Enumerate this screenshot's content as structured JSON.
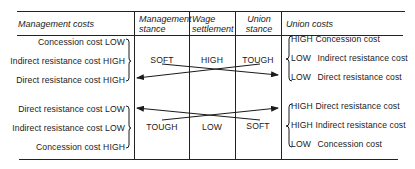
{
  "headers": {
    "management_costs": "Management costs",
    "management_stance": [
      "Management",
      "stance"
    ],
    "wage_settlement": [
      "Wage",
      "settlement"
    ],
    "union_stance": [
      "Union",
      "stance"
    ],
    "union_costs": "Union costs"
  },
  "top_block": {
    "management_costs": [
      {
        "item": "Concession cost",
        "level": "LOW"
      },
      {
        "item": "Indirect resistance cost",
        "level": "HIGH"
      },
      {
        "item": "Direct resistance cost",
        "level": "HIGH"
      }
    ],
    "management_stance": "SOFT",
    "wage_settlement": "HIGH",
    "union_stance": "TOUGH",
    "union_costs": [
      {
        "level": "HIGH",
        "item": "Concession cost"
      },
      {
        "level": "LOW",
        "item": "Indirect resistance cost"
      },
      {
        "level": "LOW",
        "item": "Direct resistance cost"
      }
    ]
  },
  "bottom_block": {
    "management_costs": [
      {
        "item": "Direct resistance cost",
        "level": "LOW"
      },
      {
        "item": "Indirect resistance cost",
        "level": "LOW"
      },
      {
        "item": "Concession cost",
        "level": "HIGH"
      }
    ],
    "management_stance": "TOUGH",
    "wage_settlement": "LOW",
    "union_stance": "SOFT",
    "union_costs": [
      {
        "level": "HIGH",
        "item": "Direct resistance cost"
      },
      {
        "level": "HIGH",
        "item": "Indirect resistance cost"
      },
      {
        "level": "LOW",
        "item": "Concession cost"
      }
    ]
  },
  "colors": {
    "ink": "#1a1a1a",
    "background": "#ffffff"
  }
}
